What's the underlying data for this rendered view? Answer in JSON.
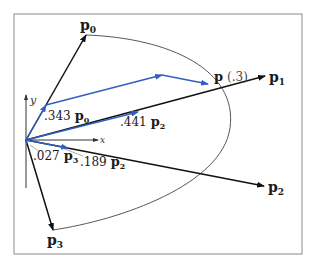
{
  "figure": {
    "frame": {
      "x": 14,
      "y": 14,
      "width": 288,
      "height": 240,
      "stroke": "#8a8a8a"
    },
    "colors": {
      "control_vector": "#111111",
      "blend_vector": "#2f5fbf",
      "curve": "#444444",
      "leader": "#777777"
    },
    "axes": {
      "x_label": "x",
      "y_label": "y",
      "origin": [
        26,
        140
      ]
    },
    "control_points": [
      {
        "name": "p",
        "sub": "0",
        "tip": [
          86,
          35
        ],
        "label_pos": [
          80,
          30
        ]
      },
      {
        "name": "p",
        "sub": "1",
        "tip": [
          265,
          76
        ],
        "label_pos": [
          269,
          82
        ]
      },
      {
        "name": "p",
        "sub": "2",
        "tip": [
          264,
          186
        ],
        "label_pos": [
          268,
          192
        ]
      },
      {
        "name": "p",
        "sub": "3",
        "tip": [
          53,
          230
        ],
        "label_pos": [
          47,
          245
        ]
      }
    ],
    "curve_point": {
      "label_main": "p",
      "label_param": "(.3)",
      "pos": [
        211,
        86
      ]
    },
    "weights": [
      {
        "coef": ".343",
        "name": "p",
        "sub": "0"
      },
      {
        "coef": ".441",
        "name": "p",
        "sub": "2"
      },
      {
        "coef": ".027",
        "name": "p",
        "sub": "3"
      },
      {
        "coef": ".189",
        "name": "p",
        "sub": "2"
      }
    ]
  }
}
